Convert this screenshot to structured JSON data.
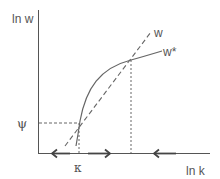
{
  "diagram": {
    "y_axis_label": "ln w",
    "x_axis_label": "ln k",
    "line_w_label": "w",
    "curve_w_star_label": "w*",
    "y_marker_label": "ψ",
    "x_marker_label": "κ",
    "colors": {
      "line": "#666666",
      "text": "#555555",
      "axis": "#555555"
    },
    "arrows": [
      {
        "direction": "left",
        "position": "left of κ"
      },
      {
        "direction": "right",
        "position": "between κ and upper intersection"
      },
      {
        "direction": "left",
        "position": "right of upper intersection"
      }
    ]
  }
}
